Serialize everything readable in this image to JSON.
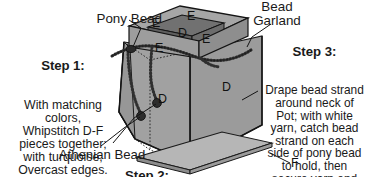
{
  "diagram": {
    "colors": {
      "body_fill": "#9d9d9d",
      "body_fill_light": "#aaaaaa",
      "lid_top_fill": "#a8a8a8",
      "lid_side_fill": "#8e8e8e",
      "rim_inner_fill": "#6e6e6e",
      "base_fill": "#b2b2b2",
      "outline": "#1a1a1a",
      "bead_dark": "#3a3a3a",
      "text": "#1a1a1a",
      "background": "#ffffff"
    }
  },
  "callouts": {
    "pony_bead": "Pony Bead",
    "bead_garland": "Bead\nGarland",
    "athenian_bead": "Athenian Bead"
  },
  "steps": {
    "step1": {
      "heading": "Step 1:",
      "body": "With matching\ncolors,\nWhipstitch D-F\npieces together;\nwith turquoise,\nOvercast edges."
    },
    "step2": {
      "heading": "Step 2:"
    },
    "step3": {
      "heading": "Step 3:",
      "body": "Drape bead strand\naround neck of\nPot; with white\nyarn, catch bead\nstrand on each\nside of pony bead\nto hold, then\nsecure yarn end\non wrong side."
    }
  },
  "piece_labels": [
    {
      "id": "lid-top-left",
      "text": "E"
    },
    {
      "id": "lid-top-right",
      "text": "E"
    },
    {
      "id": "rim-inner",
      "text": "D"
    },
    {
      "id": "lid-front-left",
      "text": "E"
    },
    {
      "id": "lid-front-right",
      "text": "E"
    },
    {
      "id": "body-front",
      "text": "D"
    },
    {
      "id": "body-side",
      "text": "D"
    },
    {
      "id": "base",
      "text": "F"
    }
  ]
}
